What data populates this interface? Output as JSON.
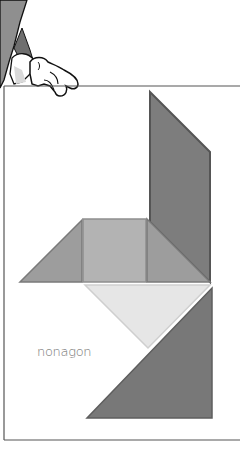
{
  "page": {
    "width": 240,
    "height": 449,
    "background": "#ffffff"
  },
  "character": {
    "description": "cartoon gloved hand gripping top edge of frame",
    "colors": {
      "arm": "#8f8f8f",
      "arm_shadow": "#6a6a6a",
      "glove": "#ffffff",
      "glove_shadow": "#d9d9d9",
      "outline": "#111111"
    }
  },
  "frame": {
    "stroke": "#555555",
    "top_y": 86,
    "left_x": 4,
    "bottom_y": 440
  },
  "tangram": {
    "pieces": [
      {
        "name": "parallelogram",
        "fill": "#7d7d7d",
        "stroke": "#555555",
        "points": "150,92 210,152 210,282 150,222"
      },
      {
        "name": "left-triangle",
        "fill": "#9d9d9d",
        "stroke": "#7a7a7a",
        "points": "82,220 82,282 20,282"
      },
      {
        "name": "square",
        "fill": "#b3b3b3",
        "stroke": "#8e8e8e",
        "points": "83,219 146,219 146,282 83,282"
      },
      {
        "name": "right-triangle",
        "fill": "#9d9d9d",
        "stroke": "#7a7a7a",
        "points": "147,219 210,282 147,282"
      },
      {
        "name": "light-triangle",
        "fill": "#e6e6e6",
        "stroke": "#cfcfcf",
        "points": "85,285 210,285 148,348"
      },
      {
        "name": "bottom-triangle",
        "fill": "#787878",
        "stroke": "#5e5e5e",
        "points": "212,288 212,418 87,418"
      }
    ]
  },
  "caption": {
    "text": "nonagon"
  }
}
